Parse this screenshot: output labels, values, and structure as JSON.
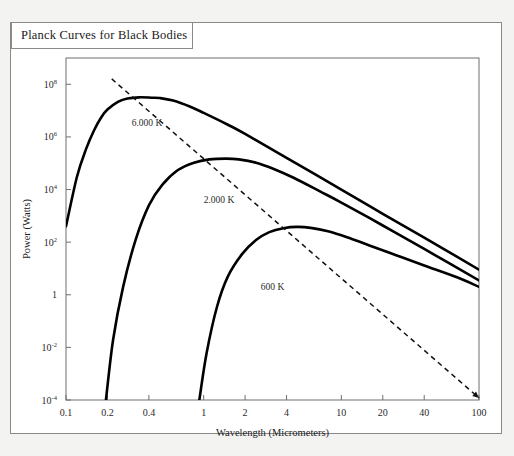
{
  "title": {
    "text": "Planck Curves for Black Bodies"
  },
  "chart_data": {
    "type": "line",
    "title": "Planck Curves for Black Bodies",
    "xlabel": "Wavelength (Micrometers)",
    "ylabel": "Power (Watts)",
    "xscale": "log",
    "yscale": "log",
    "xlim": [
      0.1,
      100
    ],
    "ylim": [
      0.0001,
      1000000000
    ],
    "grid": false,
    "legend_position": "inline-annotations",
    "xticks": [
      {
        "value": 0.1,
        "label": "0.1"
      },
      {
        "value": 0.2,
        "label": "0.2"
      },
      {
        "value": 0.4,
        "label": "0.4"
      },
      {
        "value": 1,
        "label": "1"
      },
      {
        "value": 2,
        "label": "2"
      },
      {
        "value": 4,
        "label": "4"
      },
      {
        "value": 10,
        "label": "10"
      },
      {
        "value": 20,
        "label": "20"
      },
      {
        "value": 40,
        "label": "40"
      },
      {
        "value": 100,
        "label": "100"
      }
    ],
    "yticks": [
      {
        "value": 100000000,
        "base": "10",
        "exp": "8"
      },
      {
        "value": 1000000,
        "base": "10",
        "exp": "6"
      },
      {
        "value": 10000,
        "base": "10",
        "exp": "4"
      },
      {
        "value": 100,
        "base": "10",
        "exp": "2"
      },
      {
        "value": 1,
        "base": "1",
        "exp": ""
      },
      {
        "value": 0.01,
        "base": "10",
        "exp": "-2"
      },
      {
        "value": 0.0001,
        "base": "10",
        "exp": "-4"
      }
    ],
    "series": [
      {
        "name": "6.000 K",
        "temperature_k": 6000,
        "label": "6.000 K",
        "label_x": 0.3,
        "label_y": 2500000,
        "color": "#000000",
        "peak_wavelength_um": 0.48,
        "peak_power_watts": 30000000,
        "points": [
          [
            0.1,
            400
          ],
          [
            0.12,
            30000
          ],
          [
            0.14,
            350000
          ],
          [
            0.16,
            1800000
          ],
          [
            0.18,
            5500000
          ],
          [
            0.2,
            11000000
          ],
          [
            0.24,
            22000000
          ],
          [
            0.28,
            29000000
          ],
          [
            0.34,
            32000000
          ],
          [
            0.42,
            31000000
          ],
          [
            0.48,
            30000000
          ],
          [
            0.6,
            24000000
          ],
          [
            0.8,
            14000000
          ],
          [
            1.0,
            8200000
          ],
          [
            1.5,
            2900000
          ],
          [
            2.0,
            1300000
          ],
          [
            4.0,
            160000
          ],
          [
            10.0,
            10000
          ],
          [
            20.0,
            1200
          ],
          [
            40.0,
            150
          ],
          [
            100.0,
            9
          ]
        ]
      },
      {
        "name": "2.000 K",
        "temperature_k": 2000,
        "label": "2.000 K",
        "label_x": 1.0,
        "label_y": 3000,
        "color": "#000000",
        "peak_wavelength_um": 1.45,
        "peak_power_watts": 150000,
        "points": [
          [
            0.195,
            0.0001
          ],
          [
            0.22,
            0.02
          ],
          [
            0.26,
            2.0
          ],
          [
            0.32,
            120
          ],
          [
            0.4,
            2500
          ],
          [
            0.5,
            15000
          ],
          [
            0.65,
            55000
          ],
          [
            0.85,
            105000
          ],
          [
            1.1,
            140000
          ],
          [
            1.45,
            150000
          ],
          [
            1.8,
            140000
          ],
          [
            2.4,
            105000
          ],
          [
            3.2,
            62000
          ],
          [
            4.5,
            28000
          ],
          [
            7.0,
            8500
          ],
          [
            10.0,
            3200
          ],
          [
            20.0,
            430
          ],
          [
            40.0,
            55
          ],
          [
            100.0,
            3.5
          ]
        ]
      },
      {
        "name": "600 K",
        "temperature_k": 600,
        "label": "600 K",
        "label_x": 2.6,
        "label_y": 1.5,
        "color": "#000000",
        "peak_wavelength_um": 4.8,
        "peak_power_watts": 380,
        "points": [
          [
            0.93,
            0.0001
          ],
          [
            1.05,
            0.006
          ],
          [
            1.25,
            0.35
          ],
          [
            1.5,
            5.0
          ],
          [
            1.9,
            35
          ],
          [
            2.4,
            120
          ],
          [
            3.0,
            240
          ],
          [
            3.8,
            340
          ],
          [
            4.8,
            380
          ],
          [
            6.0,
            350
          ],
          [
            8.0,
            260
          ],
          [
            11.0,
            155
          ],
          [
            16.0,
            75
          ],
          [
            25.0,
            32
          ],
          [
            40.0,
            13
          ],
          [
            70.0,
            4.5
          ],
          [
            100.0,
            2.0
          ]
        ]
      }
    ],
    "annotations": [
      {
        "name": "wien-displacement-line",
        "type": "dashed-arrow",
        "from": [
          0.215,
          160000000
        ],
        "to": [
          100,
          0.00012
        ]
      }
    ]
  }
}
